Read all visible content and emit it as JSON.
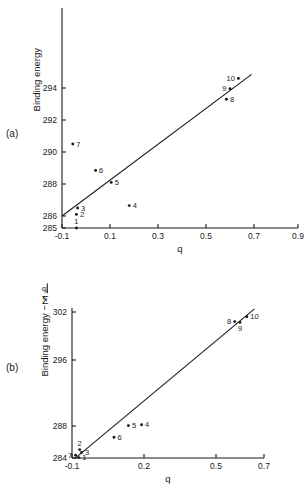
{
  "figure": {
    "panel_a_tag": "(a)",
    "panel_b_tag": "(b)"
  },
  "chart_data": [
    {
      "id": "panel-a",
      "type": "scatter",
      "title": "",
      "panel_label": "(a)",
      "xlabel": "q",
      "ylabel": "Binding energy",
      "xlim": [
        -0.1,
        0.9
      ],
      "ylim": [
        285,
        294.9
      ],
      "grid": false,
      "legend": "none",
      "xticks": [
        -0.1,
        0.1,
        0.3,
        0.5,
        0.7,
        0.9
      ],
      "xticklabels": [
        "-0.1",
        "0.1",
        "0.3",
        "0.5",
        "0.7",
        "0.9"
      ],
      "yticks": [
        285,
        286,
        288,
        290,
        292,
        294
      ],
      "yticklabels": [
        "285",
        "286",
        "288",
        "290",
        "292",
        "294"
      ],
      "y_axis_note": "non-uniform spacing: 285 to 286 compressed",
      "points": [
        {
          "label": "1",
          "x": -0.04,
          "y": 285.0,
          "label_pos": "above"
        },
        {
          "label": "2",
          "x": -0.04,
          "y": 286.1,
          "label_pos": "right"
        },
        {
          "label": "3",
          "x": -0.035,
          "y": 286.5,
          "label_pos": "right"
        },
        {
          "label": "4",
          "x": 0.18,
          "y": 286.65,
          "label_pos": "right"
        },
        {
          "label": "5",
          "x": 0.105,
          "y": 288.1,
          "label_pos": "right"
        },
        {
          "label": "6",
          "x": 0.04,
          "y": 288.85,
          "label_pos": "right"
        },
        {
          "label": "7",
          "x": -0.055,
          "y": 290.5,
          "label_pos": "right"
        },
        {
          "label": "8",
          "x": 0.585,
          "y": 293.3,
          "label_pos": "right"
        },
        {
          "label": "9",
          "x": 0.6,
          "y": 293.95,
          "label_pos": "left"
        },
        {
          "label": "10",
          "x": 0.635,
          "y": 294.6,
          "label_pos": "left"
        }
      ],
      "fit_line": {
        "x0": -0.1,
        "y0": 286.0,
        "x1": 0.69,
        "y1": 294.85
      }
    },
    {
      "id": "panel-b",
      "type": "scatter",
      "title": "",
      "panel_label": "(b)",
      "xlabel": "q",
      "ylabel": "Binding energy - Σ qⱼ/rᵢⱼ",
      "ylabel_parts": {
        "lead": "Binding energy −",
        "sigma": "Σ",
        "sigma_sub": "(i)",
        "numerator": "qⱼ",
        "denominator": "rᵢⱼ"
      },
      "xlim": [
        -0.1,
        0.7
      ],
      "ylim": [
        284,
        302.6
      ],
      "grid": false,
      "legend": "none",
      "xticks": [
        -0.1,
        0.2,
        0.5,
        0.7
      ],
      "xticklabels": [
        "-0.1",
        "0.2",
        "0.5",
        "0.7"
      ],
      "yticks": [
        284,
        288,
        296,
        302
      ],
      "yticklabels": [
        "284",
        "288",
        "296",
        "302"
      ],
      "y_axis_note": "non-uniform spacing between labelled ticks",
      "points": [
        {
          "label": "1",
          "x": -0.072,
          "y": 284.05,
          "label_pos": "right"
        },
        {
          "label": "2",
          "x": -0.068,
          "y": 285.05,
          "label_pos": "above"
        },
        {
          "label": "3",
          "x": -0.06,
          "y": 284.7,
          "label_pos": "right"
        },
        {
          "label": "4",
          "x": 0.19,
          "y": 288.15,
          "label_pos": "right"
        },
        {
          "label": "5",
          "x": 0.135,
          "y": 288.05,
          "label_pos": "right"
        },
        {
          "label": "6",
          "x": 0.075,
          "y": 286.6,
          "label_pos": "right"
        },
        {
          "label": "7",
          "x": -0.085,
          "y": 284.35,
          "label_pos": "left"
        },
        {
          "label": "8",
          "x": 0.578,
          "y": 300.8,
          "label_pos": "left"
        },
        {
          "label": "9",
          "x": 0.6,
          "y": 300.7,
          "label_pos": "below"
        },
        {
          "label": "10",
          "x": 0.628,
          "y": 301.4,
          "label_pos": "right"
        }
      ],
      "fit_line": {
        "x0": -0.09,
        "y0": 283.9,
        "x1": 0.66,
        "y1": 302.4
      }
    }
  ]
}
